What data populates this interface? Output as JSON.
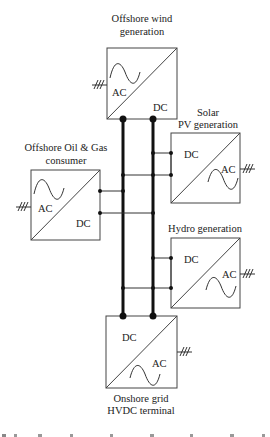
{
  "diagram": {
    "nodes": [
      {
        "id": "wind",
        "title_lines": [
          "Offshore wind",
          "generation"
        ],
        "dc_label": "DC",
        "ac_label": "AC"
      },
      {
        "id": "oilgas",
        "title_lines": [
          "Offshore Oil & Gas",
          "consumer"
        ],
        "dc_label": "DC",
        "ac_label": "AC"
      },
      {
        "id": "solar",
        "title_lines": [
          "Solar",
          "PV generation"
        ],
        "dc_label": "DC",
        "ac_label": "AC"
      },
      {
        "id": "hydro",
        "title_lines": [
          "Hydro generation"
        ],
        "dc_label": "DC",
        "ac_label": "AC"
      },
      {
        "id": "onshore",
        "title_lines": [
          "Onshore grid",
          "HVDC terminal"
        ],
        "dc_label": "DC",
        "ac_label": "AC"
      }
    ],
    "bus": {
      "conductors": 2,
      "description": "DC bus (positive and negative)"
    },
    "caption_partial": "Fig. ... (caption cut off)"
  }
}
